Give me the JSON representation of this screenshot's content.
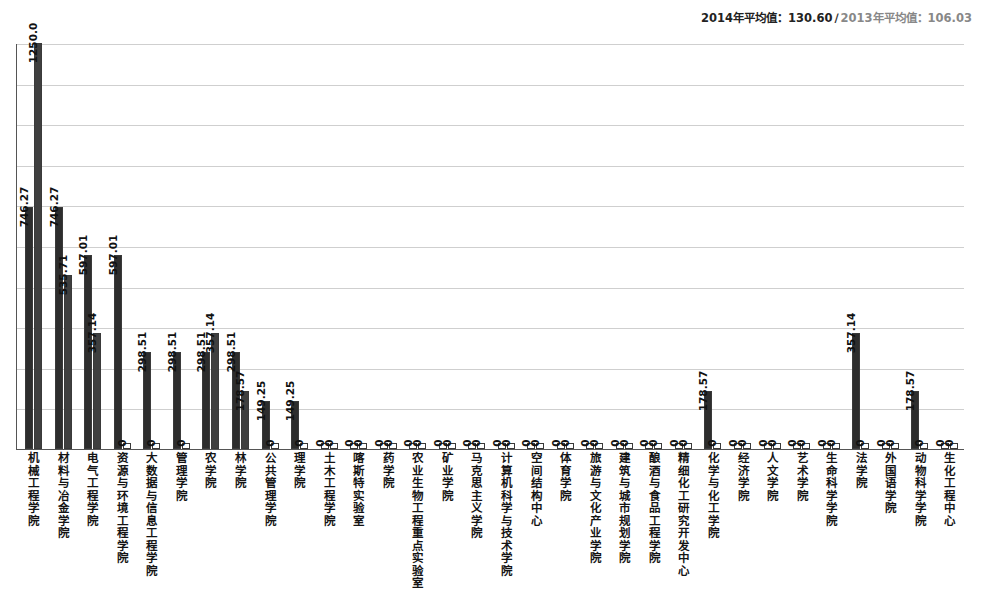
{
  "legend": {
    "series_2014_label": "2014年平均值：130.60",
    "separator": "∕",
    "series_2013_label": "2013年平均值：106.03"
  },
  "chart_data": {
    "type": "bar",
    "title": "",
    "xlabel": "",
    "ylabel": "",
    "ylim": [
      0,
      1250
    ],
    "grid": true,
    "legend_position": "top-right",
    "gridline_count": 10,
    "categories": [
      "机械工程学院",
      "材料与冶金学院",
      "电气工程学院",
      "资源与环境工程学院",
      "大数据与信息工程学院",
      "管理学院",
      "农学院",
      "林学院",
      "公共管理学院",
      "理学院",
      "土木工程学院",
      "喀斯特实验室",
      "药学院",
      "农业生物工程重点实验室",
      "矿业学院",
      "马克思主义学院",
      "计算机科学与技术学院",
      "空间结构中心",
      "体育学院",
      "旅游与文化产业学院",
      "建筑与城市规划学院",
      "酿酒与食品工程学院",
      "精细化工研究开发中心",
      "化学与化工学院",
      "经济学院",
      "人文学院",
      "艺术学院",
      "生命科学学院",
      "法学院",
      "外国语学院",
      "动物科学学院",
      "生化工程中心"
    ],
    "series": [
      {
        "name": "2014年平均值",
        "average": 130.6,
        "values": [
          746.27,
          746.27,
          597.01,
          597.01,
          298.51,
          298.51,
          298.51,
          298.51,
          149.25,
          149.25,
          0,
          0,
          0,
          0,
          0,
          0,
          0,
          0,
          0,
          0,
          0,
          0,
          0,
          178.57,
          0,
          0,
          0,
          0,
          357.14,
          0,
          178.57,
          0
        ],
        "labels": [
          "746.27",
          "746.27",
          "597.01",
          "597.01",
          "298.51",
          "298.51",
          "298.51",
          "298.51",
          "149.25",
          "149.25",
          "0",
          "0",
          "0",
          "0",
          "0",
          "0",
          "0",
          "0",
          "0",
          "0",
          "0",
          "0",
          "0",
          "178.57",
          "0",
          "0",
          "0",
          "0",
          "357.14",
          "0",
          "178.57",
          "0"
        ]
      },
      {
        "name": "2013年平均值",
        "average": 106.03,
        "values": [
          1250.0,
          535.71,
          357.14,
          0,
          0,
          0,
          357.14,
          178.57,
          0,
          0,
          0,
          0,
          0,
          0,
          0,
          0,
          0,
          0,
          0,
          0,
          0,
          0,
          0,
          0,
          0,
          0,
          0,
          0,
          0,
          0,
          0,
          0
        ],
        "labels": [
          "1250.0",
          "535.71",
          "357.14",
          "0",
          "0",
          "0",
          "357.14",
          "178.57",
          "0",
          "0",
          "0",
          "0",
          "0",
          "0",
          "0",
          "0",
          "0",
          "0",
          "0",
          "0",
          "0",
          "0",
          "0",
          "0",
          "0",
          "0",
          "0",
          "0",
          "0",
          "0",
          "0",
          "0"
        ]
      }
    ]
  }
}
